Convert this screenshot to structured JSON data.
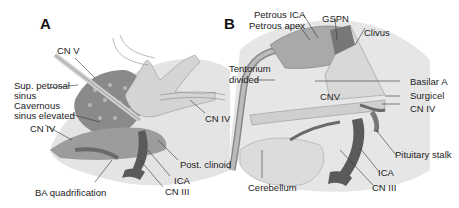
{
  "figure": {
    "panels": [
      {
        "letter": "A",
        "labels": {
          "cn_v": "CN V",
          "sup_petrosal_sinus_1": "Sup. petrosal",
          "sup_petrosal_sinus_2": "sinus",
          "cavernous_sinus_1": "Cavernous",
          "cavernous_sinus_2": "sinus elevated",
          "cn_iv_left": "CN IV",
          "cn_iv_right": "CN IV",
          "post_clinoid": "Post. clinoid",
          "ica": "ICA",
          "cn_iii": "CN III",
          "ba_quadrification": "BA quadrification"
        }
      },
      {
        "letter": "B",
        "labels": {
          "petrous_ica": "Petrous ICA",
          "petrous_apex": "Petrous apex",
          "gspn": "GSPN",
          "clivus": "Clivus",
          "tentorium_1": "Tentorium",
          "tentorium_2": "divided",
          "basilar_a": "Basilar A",
          "surgicel": "Surgicel",
          "cnv": "CNV",
          "cn_iv": "CN IV",
          "pituitary_stalk": "Pituitary stalk",
          "ica": "ICA",
          "cn_iii": "CN III",
          "cerebellum": "Cerebellum"
        }
      }
    ],
    "colors": {
      "background": "#ffffff",
      "tissue_light": "#d9d9d9",
      "tissue_mid": "#a8a8a8",
      "tissue_dark": "#6e6e6e",
      "vessel": "#5a5a5a",
      "leader_line": "#333333"
    }
  }
}
